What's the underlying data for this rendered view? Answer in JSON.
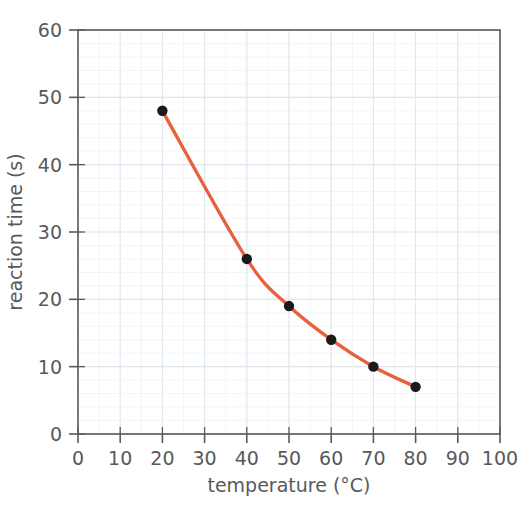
{
  "chart_data": {
    "type": "line",
    "title": "",
    "xlabel": "temperature (°C)",
    "ylabel": "reaction time (s)",
    "xlim": [
      0,
      100
    ],
    "ylim": [
      0,
      60
    ],
    "xticks": [
      0,
      10,
      20,
      30,
      40,
      50,
      60,
      70,
      80,
      90,
      100
    ],
    "yticks": [
      0,
      10,
      20,
      30,
      40,
      50,
      60
    ],
    "xtick_labels": [
      "0",
      "10",
      "20",
      "30",
      "40",
      "50",
      "60",
      "70",
      "80",
      "90",
      "100"
    ],
    "ytick_labels": [
      "0",
      "10",
      "20",
      "30",
      "40",
      "50",
      "60"
    ],
    "grid": true,
    "grid_minor": true,
    "grid_color": "#dfe7ef",
    "legend": false,
    "series": [
      {
        "name": "reaction time",
        "line_color": "#e8603c",
        "marker_color": "#1a1a1a",
        "marker": "circle",
        "x": [
          20,
          40,
          50,
          60,
          70,
          80
        ],
        "values": [
          48,
          26,
          19,
          14,
          10,
          7
        ],
        "points": [
          {
            "x": 20,
            "y": 48
          },
          {
            "x": 40,
            "y": 26
          },
          {
            "x": 50,
            "y": 19
          },
          {
            "x": 60,
            "y": 14
          },
          {
            "x": 70,
            "y": 10
          },
          {
            "x": 80,
            "y": 7
          }
        ]
      }
    ],
    "axis_color": "#58595b",
    "background": "#ffffff"
  }
}
